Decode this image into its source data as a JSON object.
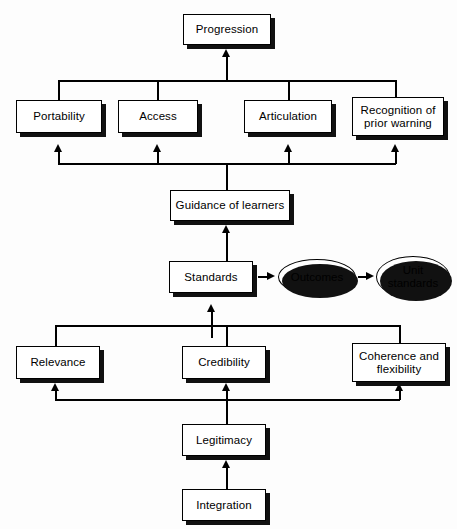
{
  "diagram": {
    "type": "flow-diagram",
    "title": "Progression",
    "background_color": "#fdfdfd",
    "line_color": "#000000",
    "box_fill": "#ffffff",
    "shadow_color": "#111111",
    "nodes": {
      "progression": {
        "label": "Progression",
        "shape": "box"
      },
      "portability": {
        "label": "Portability",
        "shape": "box"
      },
      "access": {
        "label": "Access",
        "shape": "box"
      },
      "articulation": {
        "label": "Articulation",
        "shape": "box"
      },
      "recognition": {
        "label": "Recognition of\nprior warning",
        "shape": "box"
      },
      "guidance": {
        "label": "Guidance of learners",
        "shape": "box"
      },
      "standards": {
        "label": "Standards",
        "shape": "box"
      },
      "outcomes": {
        "label": "Outcomes",
        "shape": "ellipse"
      },
      "unit_standards": {
        "label": "Unit\nstandards",
        "shape": "ellipse"
      },
      "relevance": {
        "label": "Relevance",
        "shape": "box"
      },
      "credibility": {
        "label": "Credibility",
        "shape": "box"
      },
      "coherence": {
        "label": "Coherence and\nflexibility",
        "shape": "box"
      },
      "legitimacy": {
        "label": "Legitimacy",
        "shape": "box"
      },
      "integration": {
        "label": "Integration",
        "shape": "box"
      }
    },
    "edges": [
      {
        "from": "portability",
        "to": "progression"
      },
      {
        "from": "access",
        "to": "progression"
      },
      {
        "from": "articulation",
        "to": "progression"
      },
      {
        "from": "recognition",
        "to": "progression"
      },
      {
        "from": "guidance",
        "to": "portability"
      },
      {
        "from": "guidance",
        "to": "access"
      },
      {
        "from": "guidance",
        "to": "articulation"
      },
      {
        "from": "guidance",
        "to": "recognition"
      },
      {
        "from": "standards",
        "to": "guidance"
      },
      {
        "from": "standards",
        "to": "outcomes"
      },
      {
        "from": "outcomes",
        "to": "unit_standards"
      },
      {
        "from": "relevance",
        "to": "standards"
      },
      {
        "from": "credibility",
        "to": "standards"
      },
      {
        "from": "coherence",
        "to": "standards"
      },
      {
        "from": "legitimacy",
        "to": "relevance"
      },
      {
        "from": "legitimacy",
        "to": "credibility"
      },
      {
        "from": "legitimacy",
        "to": "coherence"
      },
      {
        "from": "integration",
        "to": "legitimacy"
      }
    ]
  }
}
